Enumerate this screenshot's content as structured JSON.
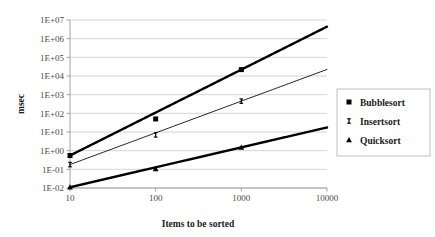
{
  "chart_data": {
    "type": "line",
    "title": "",
    "xlabel": "Items to be sorted",
    "ylabel": "msec",
    "xscale": "log",
    "yscale": "log",
    "xlim": [
      10,
      10000
    ],
    "ylim": [
      0.01,
      10000000
    ],
    "grid": true,
    "legend_position": "right",
    "x": [
      10,
      100,
      1000,
      10000
    ],
    "xtick_labels": [
      "10",
      "100",
      "1000",
      "10000"
    ],
    "ytick_labels": [
      "1E-02",
      "1E-01",
      "1E+00",
      "1E+01",
      "1E+02",
      "1E+03",
      "1E+04",
      "1E+05",
      "1E+06",
      "1E+07"
    ],
    "ytick_values": [
      0.01,
      0.1,
      1,
      10,
      100,
      1000,
      10000,
      100000,
      1000000,
      10000000
    ],
    "series": [
      {
        "name": "Bubblesort",
        "marker": "square",
        "line_weight": "thick",
        "x": [
          10,
          100,
          1000
        ],
        "values": [
          0.55,
          50,
          22000
        ]
      },
      {
        "name": "Insertsort",
        "marker": "ibar",
        "line_weight": "thin",
        "x": [
          10,
          100,
          1000
        ],
        "values": [
          0.18,
          7,
          450
        ]
      },
      {
        "name": "Quicksort",
        "marker": "triangle",
        "line_weight": "thick",
        "x": [
          10,
          100,
          1000
        ],
        "values": [
          0.011,
          0.105,
          1.5
        ]
      }
    ]
  },
  "legend": {
    "items": [
      {
        "label": "Bubblesort",
        "marker": "square"
      },
      {
        "label": "Insertsort",
        "marker": "ibar"
      },
      {
        "label": "Quicksort",
        "marker": "triangle"
      }
    ]
  },
  "colors": {
    "series": "#000000",
    "gridline": "#c9c9c9",
    "axis": "#9a9a9a",
    "text": "#1a1a1a",
    "tick_text": "#4a4a4a",
    "background": "#ffffff"
  }
}
